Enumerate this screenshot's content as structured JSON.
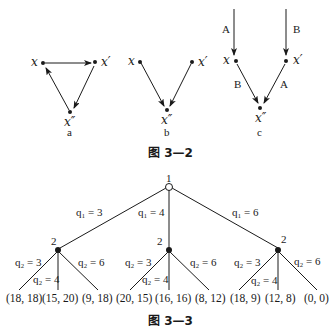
{
  "figure_3_2": {
    "caption": "图 3—2",
    "panels": [
      {
        "label": "a",
        "nodes": [
          "x",
          "x'",
          "x''"
        ],
        "edges": [
          [
            "x",
            "x'"
          ],
          [
            "x'",
            "x''"
          ],
          [
            "x''",
            "x"
          ]
        ]
      },
      {
        "label": "b",
        "nodes": [
          "x",
          "x'",
          "x''"
        ],
        "edges": [
          [
            "x",
            "x''"
          ],
          [
            "x'",
            "x''"
          ]
        ]
      },
      {
        "label": "c",
        "nodes": [
          "x",
          "x'",
          "x''"
        ],
        "edges": [
          {
            "from": "top",
            "to": "x",
            "label": "A"
          },
          {
            "from": "top",
            "to": "x'",
            "label": "B"
          },
          {
            "from": "x",
            "to": "x''",
            "label": "B"
          },
          {
            "from": "x'",
            "to": "x''",
            "label": "A"
          }
        ]
      }
    ],
    "node_labels": {
      "x": "x",
      "xp": "x′",
      "xpp": "x″"
    },
    "edge_labels": {
      "A": "A",
      "B": "B"
    }
  },
  "figure_3_3": {
    "caption": "图 3—3",
    "root": {
      "player": "1"
    },
    "level1": {
      "player": "2",
      "branches": [
        {
          "label": "q₁ = 3",
          "sub": [
            "q₂ = 3",
            "q₂ = 4",
            "q₂ = 6"
          ],
          "payoffs": [
            "(18, 18)",
            "(15, 20)",
            "(9, 18)"
          ]
        },
        {
          "label": "q₁ = 4",
          "sub": [
            "q₂ = 3",
            "q₂ = 4",
            "q₂ = 6"
          ],
          "payoffs": [
            "(20, 15)",
            "(16, 16)",
            "(8, 12)"
          ]
        },
        {
          "label": "q₁ = 6",
          "sub": [
            "q₂ = 3",
            "q₂ = 4",
            "q₂ = 6"
          ],
          "payoffs": [
            "(18, 9)",
            "(12, 8)",
            "(0, 0)"
          ]
        }
      ]
    }
  }
}
